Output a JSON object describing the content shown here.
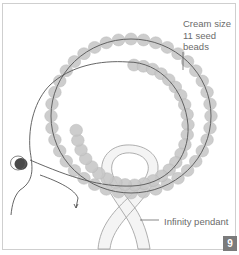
{
  "figure": {
    "step_number": "9",
    "labels": {
      "seed_beads": "Cream size\n11 seed\nbeads",
      "pendant": "Infinity pendant"
    },
    "colors": {
      "bead_fill": "#c8c8c8",
      "bead_stroke": "#b4b4b4",
      "thread": "#555555",
      "accent_bead": "#4a4a4a",
      "pendant_fill": "#f4f4f4",
      "pendant_stroke": "#9a9a9a",
      "badge": "#7b7b7b",
      "frame": "#cfcfcf"
    }
  }
}
